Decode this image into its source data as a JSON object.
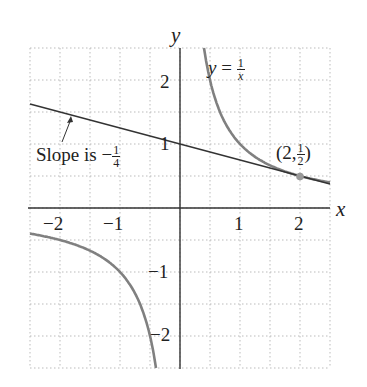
{
  "chart_data": {
    "type": "line",
    "title": "",
    "xlabel": "x",
    "ylabel": "y",
    "xlim": [
      -2.5,
      2.5
    ],
    "ylim": [
      -2.5,
      2.5
    ],
    "grid": true,
    "grid_step": 0.5,
    "x_ticks": [
      "-2",
      "-1",
      "1",
      "2"
    ],
    "y_ticks": [
      "2",
      "1",
      "-1",
      "-2"
    ],
    "series": [
      {
        "name": "y = 1/x",
        "kind": "curve",
        "function": "1/x",
        "color": "#808080"
      },
      {
        "name": "tangent line",
        "kind": "line",
        "function": "-x/4 + 1",
        "slope": -0.25,
        "intercept": 1,
        "color": "#333333"
      }
    ],
    "points": [
      {
        "x": 2,
        "y": 0.5,
        "label": "(2, 1/2)"
      }
    ],
    "annotations": [
      {
        "text": "Slope is -1/4",
        "points_to": "tangent line"
      },
      {
        "text": "y = 1/x",
        "labels": "curve"
      }
    ]
  },
  "labels": {
    "x_axis": "x",
    "y_axis": "y",
    "xt_m2": "−2",
    "xt_m1": "−1",
    "xt_1": "1",
    "xt_2": "2",
    "yt_2": "2",
    "yt_1": "1",
    "yt_m1": "−1",
    "yt_m2": "−2",
    "curve_y": "y",
    "curve_eq": " = ",
    "curve_num": "1",
    "curve_den": "x",
    "slope_text": "Slope is −",
    "slope_num": "1",
    "slope_den": "4",
    "pt_open": "(2,",
    "pt_num": "1",
    "pt_den": "2",
    "pt_close": ")"
  }
}
